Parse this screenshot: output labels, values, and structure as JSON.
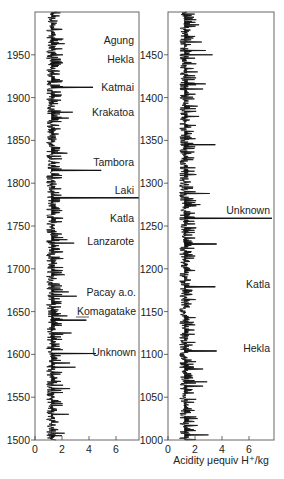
{
  "chart_data": [
    {
      "type": "line",
      "panel": "left",
      "title": "",
      "xlabel": "",
      "ylabel": "",
      "ylim": [
        1500,
        2000
      ],
      "xlim": [
        0,
        7.7
      ],
      "x_ticks": [
        0,
        2,
        4,
        6
      ],
      "y_ticks": [
        1500,
        1550,
        1600,
        1650,
        1700,
        1750,
        1800,
        1850,
        1900,
        1950
      ],
      "baseline": 1.2,
      "grid": false,
      "peaks": [
        {
          "year": 1963,
          "value": 2.2
        },
        {
          "year": 1947,
          "value": 1.7
        },
        {
          "year": 1912,
          "value": 4.3
        },
        {
          "year": 1883,
          "value": 2.8
        },
        {
          "year": 1876,
          "value": 2.5
        },
        {
          "year": 1835,
          "value": 2.4
        },
        {
          "year": 1815,
          "value": 4.9
        },
        {
          "year": 1809,
          "value": 2.0
        },
        {
          "year": 1783,
          "value": 7.7
        },
        {
          "year": 1755,
          "value": 2.0
        },
        {
          "year": 1730,
          "value": 2.9
        },
        {
          "year": 1734,
          "value": 2.4
        },
        {
          "year": 1693,
          "value": 2.2
        },
        {
          "year": 1680,
          "value": 2.0
        },
        {
          "year": 1673,
          "value": 2.5
        },
        {
          "year": 1668,
          "value": 3.1
        },
        {
          "year": 1640,
          "value": 3.8
        },
        {
          "year": 1645,
          "value": 2.4
        },
        {
          "year": 1625,
          "value": 2.7
        },
        {
          "year": 1601,
          "value": 4.5
        },
        {
          "year": 1590,
          "value": 2.6
        },
        {
          "year": 1585,
          "value": 3.0
        },
        {
          "year": 1560,
          "value": 2.6
        },
        {
          "year": 1530,
          "value": 2.5
        },
        {
          "year": 1508,
          "value": 2.2
        }
      ],
      "annotations": [
        {
          "label": "Agung",
          "year": 1963
        },
        {
          "label": "Hekla",
          "year": 1947
        },
        {
          "label": "Katmai",
          "year": 1912
        },
        {
          "label": "Krakatoa",
          "year": 1883
        },
        {
          "label": "Tambora",
          "year": 1815
        },
        {
          "label": "Laki",
          "year": 1783
        },
        {
          "label": "Katla",
          "year": 1755
        },
        {
          "label": "Lanzarote",
          "year": 1730
        },
        {
          "label": "Pacay a.o.",
          "year": 1668
        },
        {
          "label": "Komagatake",
          "year": 1640
        },
        {
          "label": "Unknown",
          "year": 1601
        }
      ]
    },
    {
      "type": "line",
      "panel": "right",
      "title": "",
      "xlabel": "Acidity μequiv H⁺/kg",
      "ylabel": "",
      "ylim": [
        1000,
        1500
      ],
      "xlim": [
        0,
        7.7
      ],
      "x_ticks": [
        0,
        2,
        4,
        6
      ],
      "y_ticks": [
        1000,
        1050,
        1100,
        1150,
        1200,
        1250,
        1300,
        1350,
        1400,
        1450
      ],
      "baseline": 1.2,
      "grid": false,
      "peaks": [
        {
          "year": 1485,
          "value": 2.3
        },
        {
          "year": 1465,
          "value": 2.5
        },
        {
          "year": 1455,
          "value": 2.8
        },
        {
          "year": 1450,
          "value": 3.3
        },
        {
          "year": 1430,
          "value": 2.2
        },
        {
          "year": 1416,
          "value": 2.8
        },
        {
          "year": 1410,
          "value": 2.6
        },
        {
          "year": 1390,
          "value": 2.2
        },
        {
          "year": 1378,
          "value": 2.3
        },
        {
          "year": 1345,
          "value": 3.5
        },
        {
          "year": 1310,
          "value": 2.1
        },
        {
          "year": 1288,
          "value": 3.1
        },
        {
          "year": 1275,
          "value": 2.4
        },
        {
          "year": 1259,
          "value": 7.7
        },
        {
          "year": 1229,
          "value": 3.6
        },
        {
          "year": 1179,
          "value": 3.5
        },
        {
          "year": 1170,
          "value": 1.8
        },
        {
          "year": 1104,
          "value": 3.6
        },
        {
          "year": 1083,
          "value": 2.6
        },
        {
          "year": 1068,
          "value": 2.9
        },
        {
          "year": 1063,
          "value": 2.6
        },
        {
          "year": 1025,
          "value": 2.2
        },
        {
          "year": 1017,
          "value": 2.2
        },
        {
          "year": 1006,
          "value": 3.0
        }
      ],
      "annotations": [
        {
          "label": "Unknown",
          "year": 1259
        },
        {
          "label": "Katla",
          "year": 1179
        },
        {
          "label": "Hekla",
          "year": 1104
        }
      ]
    }
  ],
  "left_panel": {
    "y_tick_labels": [
      "1950",
      "1900",
      "1850",
      "1800",
      "1750",
      "1700",
      "1650",
      "1600",
      "1550",
      "1500"
    ],
    "x_tick_labels": [
      "0",
      "2",
      "4",
      "6"
    ],
    "labels": {
      "agung": "Agung",
      "hekla": "Hekla",
      "katmai": "Katmai",
      "krakatoa": "Krakatoa",
      "tambora": "Tambora",
      "laki": "Laki",
      "katla": "Katla",
      "lanzarote": "Lanzarote",
      "pacay": "Pacay a.o.",
      "komagatake": "Komagatake",
      "unknown": "Unknown"
    }
  },
  "right_panel": {
    "y_tick_labels": [
      "1450",
      "1400",
      "1350",
      "1300",
      "1250",
      "1200",
      "1150",
      "1100",
      "1050",
      "1000"
    ],
    "x_tick_labels": [
      "0",
      "2",
      "4",
      "6"
    ],
    "x_axis_title": "Acidity μequiv H⁺/kg",
    "labels": {
      "unknown": "Unknown",
      "katla": "Katla",
      "hekla": "Hekla"
    }
  },
  "colors": {
    "ink": "#111111",
    "frame": "#555555",
    "background": "#ffffff"
  }
}
